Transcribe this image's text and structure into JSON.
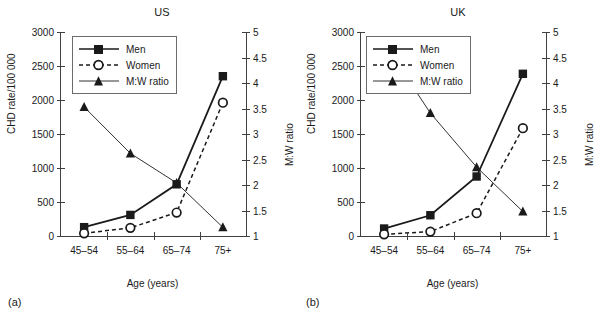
{
  "figure": {
    "caption_a": "(a)",
    "caption_b": "(b)"
  },
  "panels": [
    {
      "title": "US",
      "caption": "(a)",
      "xlabel": "Age (years)",
      "ylabel_left": "CHD rate/100 000",
      "ylabel_right": "M:W ratio",
      "legend": [
        {
          "label": "Men",
          "key": "solid-line-filled-square"
        },
        {
          "label": "Women",
          "key": "dashed-line-open-circle"
        },
        {
          "label": "M:W ratio",
          "key": "thin-line-filled-triangle"
        }
      ]
    },
    {
      "title": "UK",
      "caption": "(b)",
      "xlabel": "Age (years)",
      "ylabel_left": "CHD rate/100 000",
      "ylabel_right": "M:W ratio",
      "legend": [
        {
          "label": "Men",
          "key": "solid-line-filled-square"
        },
        {
          "label": "Women",
          "key": "dashed-line-open-circle"
        },
        {
          "label": "M:W ratio",
          "key": "thin-line-filled-triangle"
        }
      ]
    }
  ],
  "chart_data": [
    {
      "type": "line",
      "title": "US",
      "caption": "(a)",
      "xlabel": "Age (years)",
      "ylabel": "CHD rate/100 000",
      "y2label": "M:W ratio",
      "categories": [
        "45–54",
        "55–64",
        "65–74",
        "75+"
      ],
      "yticks": [
        0,
        500,
        1000,
        1500,
        2000,
        2500,
        3000
      ],
      "ylim": [
        0,
        3000
      ],
      "y2ticks": [
        1,
        1.5,
        2,
        2.5,
        3,
        3.5,
        4,
        4.5,
        5
      ],
      "y2lim": [
        1,
        5
      ],
      "grid": false,
      "legend_position": "upper-left-inside",
      "series": [
        {
          "name": "Men",
          "axis": "left",
          "marker": "filled-square",
          "line": "solid",
          "values": [
            130,
            310,
            760,
            2350
          ]
        },
        {
          "name": "Women",
          "axis": "left",
          "marker": "open-circle",
          "line": "dashed",
          "values": [
            40,
            120,
            345,
            1960
          ]
        },
        {
          "name": "M:W ratio",
          "axis": "right",
          "marker": "filled-triangle",
          "line": "thin-solid",
          "values": [
            3.53,
            2.62,
            2.04,
            1.17
          ]
        }
      ]
    },
    {
      "type": "line",
      "title": "UK",
      "caption": "(b)",
      "xlabel": "Age (years)",
      "ylabel": "CHD rate/100 000",
      "y2label": "M:W ratio",
      "categories": [
        "45–54",
        "55–64",
        "65–74",
        "75+"
      ],
      "yticks": [
        0,
        500,
        1000,
        1500,
        2000,
        2500,
        3000
      ],
      "ylim": [
        0,
        3000
      ],
      "y2ticks": [
        1,
        1.5,
        2,
        2.5,
        3,
        3.5,
        4,
        4.5,
        5
      ],
      "y2lim": [
        1,
        5
      ],
      "grid": false,
      "legend_position": "upper-center-inside",
      "series": [
        {
          "name": "Men",
          "axis": "left",
          "marker": "filled-square",
          "line": "solid",
          "values": [
            110,
            305,
            875,
            2385
          ]
        },
        {
          "name": "Women",
          "axis": "left",
          "marker": "open-circle",
          "line": "dashed",
          "values": [
            25,
            65,
            335,
            1585
          ]
        },
        {
          "name": "M:W ratio",
          "axis": "right",
          "marker": "filled-triangle",
          "line": "thin-solid",
          "values": [
            4.78,
            3.41,
            2.35,
            1.48
          ]
        }
      ]
    }
  ]
}
